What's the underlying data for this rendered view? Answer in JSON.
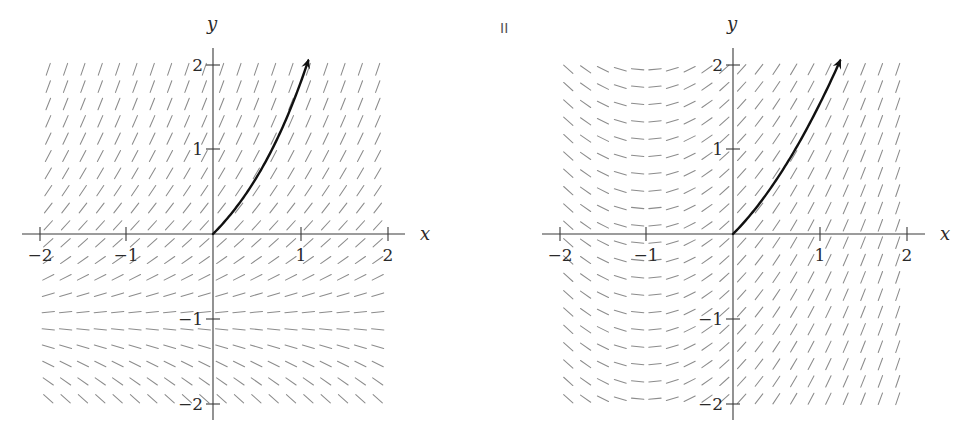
{
  "panel_label": "II",
  "plots": [
    {
      "id": "left",
      "equation": "dy/dx = y + 1",
      "slope_depends_on": "y",
      "x_axis_label": "x",
      "y_axis_label": "y",
      "x_ticks": [
        "−2",
        "−1",
        "1",
        "2"
      ],
      "y_ticks": [
        "2",
        "1",
        "−1",
        "−2"
      ],
      "solution_curve": "y = e^x − 1",
      "origin_px": [
        213,
        234
      ]
    },
    {
      "id": "right",
      "equation": "dy/dx = x + 1",
      "slope_depends_on": "x",
      "x_axis_label": "x",
      "y_axis_label": "y",
      "x_ticks": [
        "−2",
        "−1",
        "1",
        "2"
      ],
      "y_ticks": [
        "2",
        "1",
        "−1",
        "−2"
      ],
      "solution_curve": "y = x²/2 + x",
      "origin_px": [
        733,
        234
      ]
    }
  ],
  "style": {
    "segment_color": "#8c8c8c",
    "axis_color": "#3a3a3a",
    "curve_color": "#111111",
    "background": "#ffffff"
  },
  "grid": {
    "start": -1.9,
    "step": 0.2,
    "count": 20,
    "units_px": 86.7
  }
}
